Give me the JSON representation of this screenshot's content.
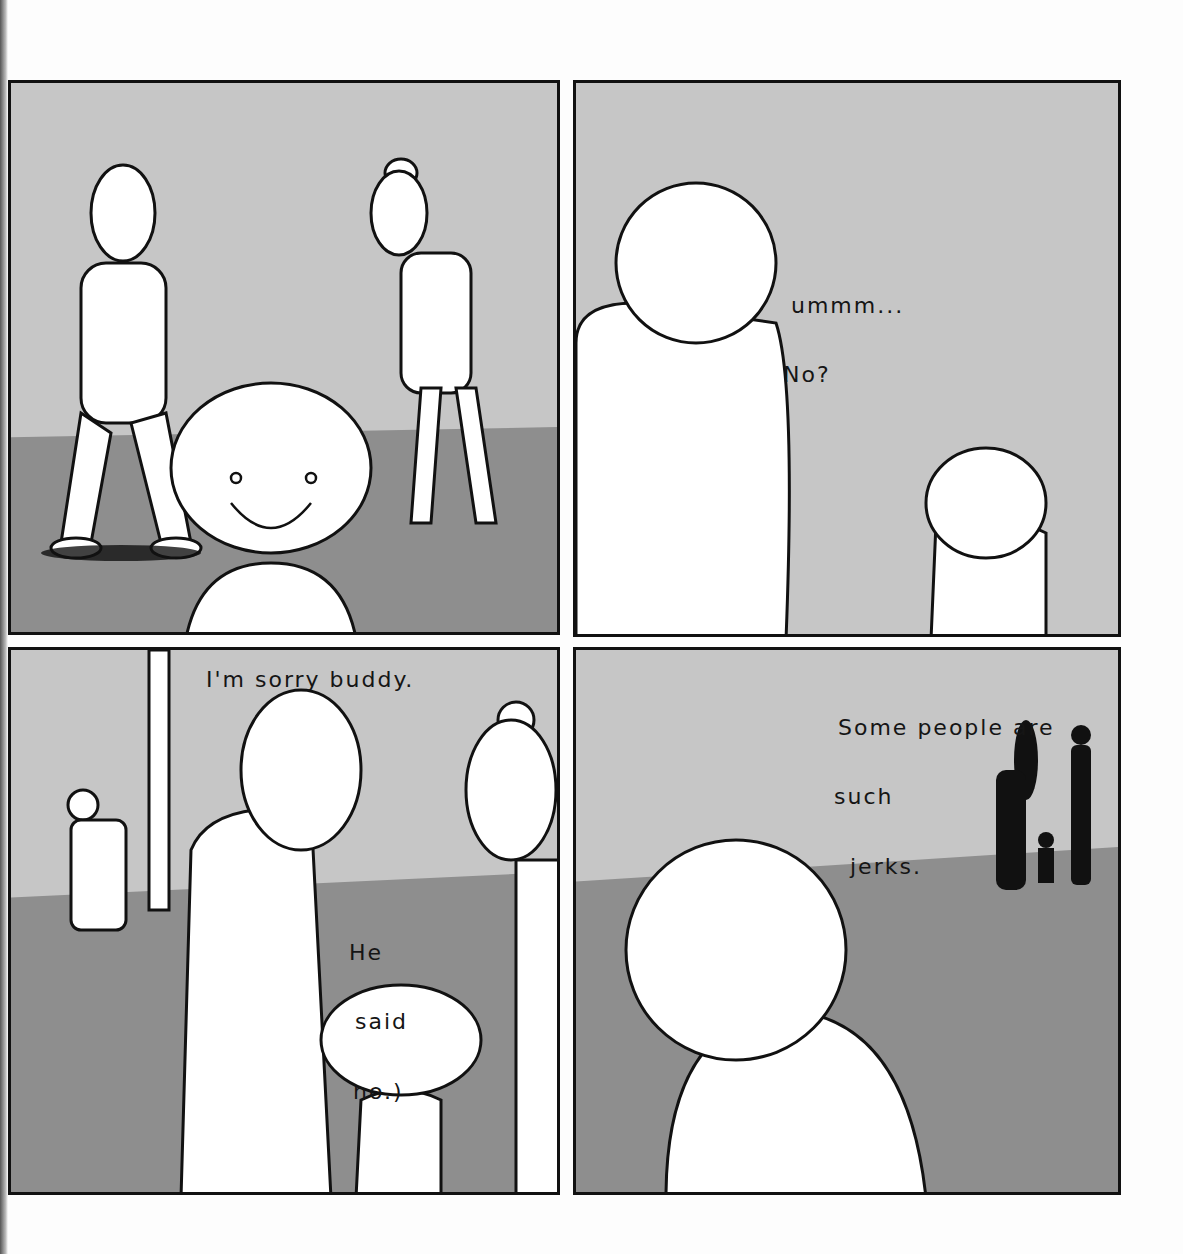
{
  "comic": {
    "panels": [
      {
        "id": 1,
        "dialogue": []
      },
      {
        "id": 2,
        "dialogue": [
          {
            "line1": "ummm...",
            "line2": "No?"
          }
        ]
      },
      {
        "id": 3,
        "dialogue": [
          {
            "text": "I'm sorry buddy."
          },
          {
            "line1": "He",
            "line2": "said",
            "line3": "no.)"
          }
        ]
      },
      {
        "id": 4,
        "dialogue": [
          {
            "line1": "Some people are",
            "line2": "such",
            "line3": "jerks."
          }
        ]
      }
    ]
  },
  "colors": {
    "sky": "#c6c6c6",
    "ground": "#8e8e8e",
    "ink": "#111111",
    "paper": "#fdfdfd"
  }
}
